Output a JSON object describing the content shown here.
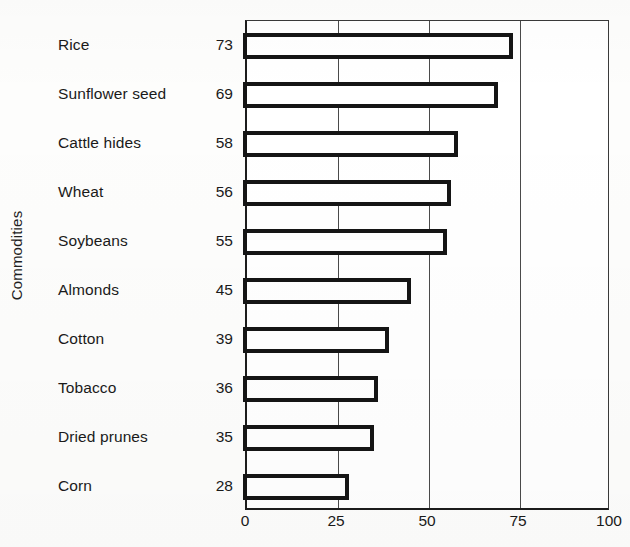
{
  "chart_data": {
    "type": "bar",
    "orientation": "horizontal",
    "title": "",
    "xlabel": "",
    "ylabel": "Commodities",
    "categories": [
      "Rice",
      "Sunflower seed",
      "Cattle hides",
      "Wheat",
      "Soybeans",
      "Almonds",
      "Cotton",
      "Tobacco",
      "Dried prunes",
      "Corn"
    ],
    "values": [
      73,
      69,
      58,
      56,
      55,
      45,
      39,
      36,
      35,
      28
    ],
    "xlim": [
      0,
      100
    ],
    "xticks": [
      0,
      25,
      50,
      75,
      100
    ],
    "xtick_labels": [
      "0",
      "25",
      "50",
      "75",
      "100"
    ],
    "grid": true,
    "grid_axis": "x",
    "legend": false,
    "bar_style": "hollow-outline",
    "colors": {
      "bar_outline": "#151515",
      "bar_fill": "#ffffff",
      "axis": "#1c1c1c",
      "gridline": "#4a4a4a",
      "text": "#1a1a1a",
      "background": "#fdfdfc"
    }
  }
}
